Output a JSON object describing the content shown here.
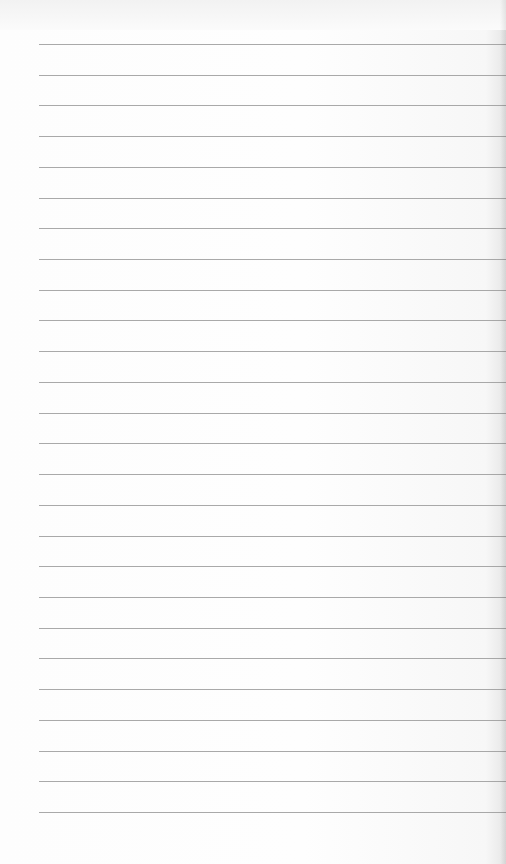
{
  "page": {
    "type": "lined-notepad-sheet",
    "background_color": "#fcfcfc",
    "line_color": "#9a9a9a",
    "line_count": 26,
    "first_line_y": 44,
    "line_spacing": 30.72,
    "line_left_margin": 39,
    "text": ""
  }
}
